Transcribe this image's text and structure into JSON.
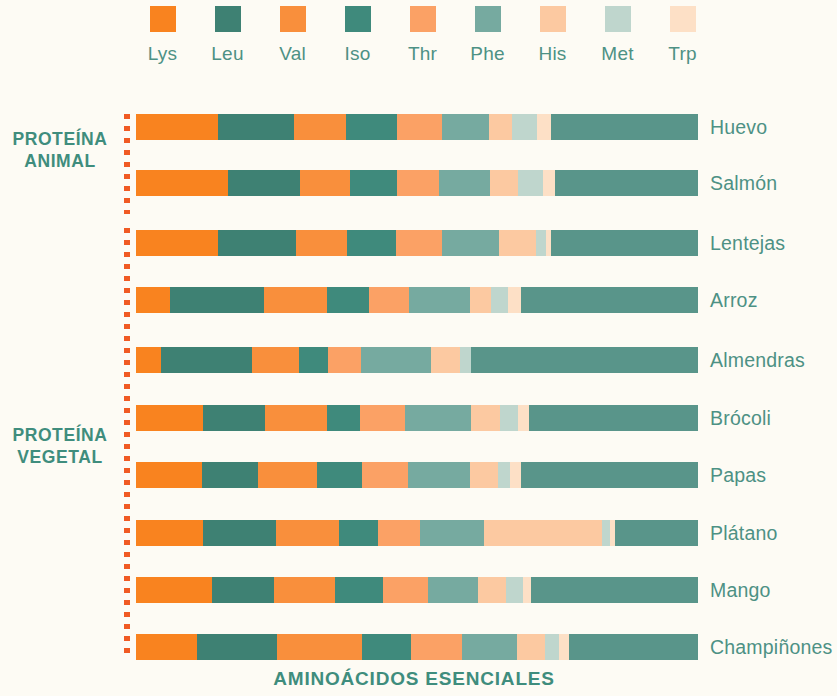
{
  "title": "",
  "axis_title": "AMINOÁCIDOS ESENCIALES",
  "groups": {
    "animal": "PROTEÍNA\nANIMAL",
    "animal_line1": "PROTEÍNA",
    "animal_line2": "ANIMAL",
    "vegetal_line1": "PROTEÍNA",
    "vegetal_line2": "VEGETAL"
  },
  "colors": {
    "background": "#fdfbf4",
    "teal_text": "#4d9184",
    "teal_heading": "#3f8d7d",
    "orange_dot": "#f05a23",
    "lys": "#f9831f",
    "leu": "#3e8173",
    "val": "#f98f3c",
    "iso": "#3f8a7c",
    "thr": "#fba165",
    "phe": "#76aaa0",
    "his": "#fcc9a1",
    "met": "#bfd6cd",
    "trp": "#fde0c6",
    "remainder": "#59958a"
  },
  "legend": [
    {
      "key": "lys",
      "label": "Lys",
      "color": "#f9831f"
    },
    {
      "key": "leu",
      "label": "Leu",
      "color": "#3e8173"
    },
    {
      "key": "val",
      "label": "Val",
      "color": "#f98f3c"
    },
    {
      "key": "iso",
      "label": "Iso",
      "color": "#3f8a7c"
    },
    {
      "key": "thr",
      "label": "Thr",
      "color": "#fba165"
    },
    {
      "key": "phe",
      "label": "Phe",
      "color": "#76aaa0"
    },
    {
      "key": "his",
      "label": "His",
      "color": "#fcc9a1"
    },
    {
      "key": "met",
      "label": "Met",
      "color": "#bfd6cd"
    },
    {
      "key": "trp",
      "label": "Trp",
      "color": "#fde0c6"
    }
  ],
  "rows": [
    {
      "label": "Huevo",
      "group": "animal",
      "top": 114
    },
    {
      "label": "Salmón",
      "group": "animal",
      "top": 170
    },
    {
      "label": "Lentejas",
      "group": "vegetal",
      "top": 230
    },
    {
      "label": "Arroz",
      "group": "vegetal",
      "top": 287
    },
    {
      "label": "Almendras",
      "group": "vegetal",
      "top": 347
    },
    {
      "label": "Brócoli",
      "group": "vegetal",
      "top": 405
    },
    {
      "label": "Papas",
      "group": "vegetal",
      "top": 462
    },
    {
      "label": "Plátano",
      "group": "vegetal",
      "top": 520
    },
    {
      "label": "Mango",
      "group": "vegetal",
      "top": 577
    },
    {
      "label": "Champiñones",
      "group": "vegetal",
      "top": 634
    }
  ],
  "chart_data": {
    "type": "bar",
    "subtype": "stacked-horizontal-100pct",
    "title": "",
    "xlabel": "AMINOÁCIDOS ESENCIALES",
    "ylabel": "",
    "legend_position": "top",
    "grid": false,
    "xlim": [
      0,
      100
    ],
    "categories": [
      "Huevo",
      "Salmón",
      "Lentejas",
      "Arroz",
      "Almendras",
      "Brócoli",
      "Papas",
      "Plátano",
      "Mango",
      "Champiñones"
    ],
    "category_groups": {
      "PROTEÍNA ANIMAL": [
        "Huevo",
        "Salmón"
      ],
      "PROTEÍNA VEGETAL": [
        "Lentejas",
        "Arroz",
        "Almendras",
        "Brócoli",
        "Papas",
        "Plátano",
        "Mango",
        "Champiñones"
      ]
    },
    "series": [
      {
        "name": "Lys",
        "color": "#f9831f",
        "values": [
          14.6,
          16.4,
          14.6,
          6.0,
          4.4,
          11.9,
          11.7,
          11.9,
          13.5,
          10.9
        ]
      },
      {
        "name": "Leu",
        "color": "#3e8173",
        "values": [
          13.5,
          12.8,
          13.9,
          16.7,
          16.2,
          11.0,
          10.0,
          13.0,
          11.0,
          14.2
        ]
      },
      {
        "name": "Val",
        "color": "#f98f3c",
        "values": [
          9.2,
          8.9,
          9.1,
          11.2,
          8.4,
          11.0,
          10.5,
          11.2,
          11.0,
          15.2
        ]
      },
      {
        "name": "Iso",
        "color": "#3f8a7c",
        "values": [
          9.2,
          8.4,
          8.7,
          7.6,
          5.2,
          5.9,
          8.0,
          6.9,
          8.4,
          8.7
        ]
      },
      {
        "name": "Thr",
        "color": "#fba165",
        "values": [
          8.0,
          7.5,
          8.1,
          7.1,
          5.9,
          8.0,
          8.2,
          7.6,
          8.0,
          9.0
        ]
      },
      {
        "name": "Phe",
        "color": "#76aaa0",
        "values": [
          8.4,
          9.0,
          10.2,
          10.8,
          12.4,
          11.9,
          11.0,
          11.4,
          9.0,
          9.8
        ]
      },
      {
        "name": "His",
        "color": "#fcc9a1",
        "values": [
          4.0,
          5.0,
          6.5,
          3.8,
          5.2,
          5.0,
          5.0,
          21.0,
          4.9,
          5.0
        ]
      },
      {
        "name": "Met",
        "color": "#bfd6cd",
        "values": [
          4.4,
          4.4,
          1.8,
          3.0,
          2.0,
          3.3,
          2.2,
          1.3,
          3.0,
          2.5
        ]
      },
      {
        "name": "Trp",
        "color": "#fde0c6",
        "values": [
          2.5,
          2.2,
          1.0,
          2.4,
          0.0,
          2.0,
          2.0,
          1.0,
          1.5,
          1.8
        ]
      },
      {
        "name": "Resto",
        "color": "#59958a",
        "values": [
          26.2,
          25.4,
          26.1,
          31.4,
          40.3,
          30.0,
          31.4,
          14.7,
          29.7,
          22.9
        ]
      }
    ]
  }
}
